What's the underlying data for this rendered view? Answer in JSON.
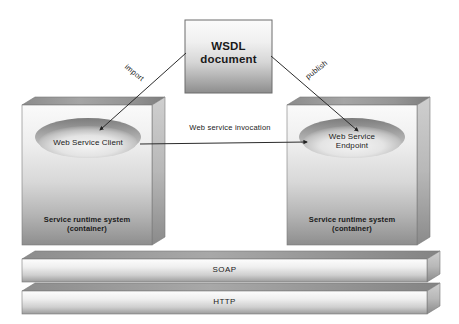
{
  "diagram": {
    "title_nodes": {
      "wsdl": {
        "line1": "WSDL",
        "line2": "document"
      },
      "client_box": {
        "ellipse_line1": "Web Service Client",
        "ellipse_line2": "",
        "caption_line1": "Service runtime system",
        "caption_line2": "(container)"
      },
      "endpoint_box": {
        "ellipse_line1": "Web Service",
        "ellipse_line2": "Endpoint",
        "caption_line1": "Service runtime system",
        "caption_line2": "(container)"
      }
    },
    "edges": {
      "import_label": "import",
      "publish_label": "publish",
      "invocation_label": "Web service invocation"
    },
    "stack": {
      "soap_label": "SOAP",
      "http_label": "HTTP"
    },
    "colors": {
      "background": "#ffffff",
      "text": "#1a1a1a",
      "line": "#2b2b2b",
      "face_light": "#f2f2f2",
      "face_mid": "#c9c9c9",
      "face_dark": "#8f8f8f",
      "top_face": "#9d9d9d",
      "side_face": "#b4b4b4",
      "ellipse_rim": "#8a8a8a",
      "ellipse_fill": "#e3e3e3",
      "box_border": "#6d6d6d"
    }
  }
}
